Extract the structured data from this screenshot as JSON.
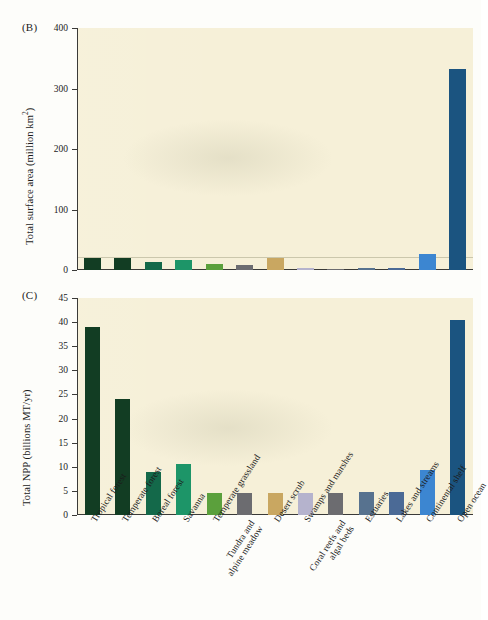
{
  "figure": {
    "panel_b_letter": "(B)",
    "panel_c_letter": "(C)"
  },
  "chart_data": [
    {
      "type": "bar",
      "panel": "(B)",
      "title": "",
      "xlabel": "",
      "ylabel": "Total surface area (million km²)",
      "ylim": [
        0,
        400
      ],
      "yticks": [
        0,
        100,
        200,
        300,
        400
      ],
      "ytick_labels": [
        "0",
        "100",
        "200",
        "300",
        "400"
      ],
      "grid": false,
      "categories": [
        "Tropical forest",
        "Temperate forest",
        "Boreal forest",
        "Savanna",
        "Temperate grassland",
        "Tundra and alpine meadow",
        "Desert scrub",
        "Swamps and marshes",
        "Coral reefs and algal beds",
        "Estuaries",
        "Lakes and streams",
        "Continental shelf",
        "Open ocean"
      ],
      "values": [
        20,
        20,
        14,
        16,
        10,
        9,
        20,
        3,
        2,
        3,
        3,
        27,
        332
      ],
      "colors": [
        "#123d23",
        "#123d23",
        "#14694a",
        "#1d9568",
        "#5ba03c",
        "#6c6c70",
        "#c9a761",
        "#b5b3cd",
        "#6c6c70",
        "#57728f",
        "#4b6a96",
        "#3c86d1",
        "#1b5480"
      ]
    },
    {
      "type": "bar",
      "panel": "(C)",
      "title": "",
      "xlabel": "",
      "ylabel": "Total NPP (billions MT/yr)",
      "ylim": [
        0,
        45
      ],
      "yticks": [
        0,
        5,
        10,
        15,
        20,
        25,
        30,
        35,
        40,
        45
      ],
      "ytick_labels": [
        "0",
        "5",
        "10",
        "15",
        "20",
        "25",
        "30",
        "35",
        "40",
        "45"
      ],
      "grid": false,
      "categories": [
        "Tropical forest",
        "Temperate forest",
        "Boreal forest",
        "Savanna",
        "Temperate grassland",
        "Tundra and alpine meadow",
        "Desert scrub",
        "Swamps and marshes",
        "Coral reefs and algal beds",
        "Estuaries",
        "Lakes and streams",
        "Continental shelf",
        "Open ocean"
      ],
      "values": [
        39.0,
        24.0,
        9.0,
        10.5,
        4.6,
        4.5,
        4.5,
        4.6,
        4.6,
        4.7,
        4.7,
        9.3,
        40.5
      ],
      "colors": [
        "#123d23",
        "#123d23",
        "#14694a",
        "#1d9568",
        "#5ba03c",
        "#6c6c70",
        "#c9a761",
        "#b5b3cd",
        "#6c6c70",
        "#57728f",
        "#4b6a96",
        "#3c86d1",
        "#1b5480"
      ]
    }
  ],
  "categories": [
    "Tropical forest",
    "Temperate forest",
    "Boreal forest",
    "Savanna",
    "Temperate grassland",
    "Tundra and alpine meadow",
    "Desert scrub",
    "Swamps and marshes",
    "Coral reefs and algal beds",
    "Estuaries",
    "Lakes and streams",
    "Continental shelf",
    "Open ocean"
  ],
  "colors": {
    "plot_background": "#f6f0d8",
    "axis": "#3a3a38",
    "page_background": "#fdfdfa"
  }
}
